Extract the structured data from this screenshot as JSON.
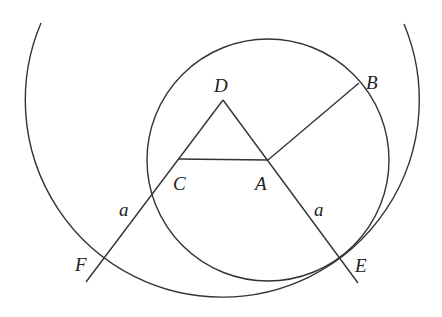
{
  "diagram": {
    "type": "geometry",
    "stroke_color": "#333333",
    "background": "#ffffff",
    "points": {
      "D": {
        "label": "D",
        "x": 223,
        "y": 100,
        "label_x": 214,
        "label_y": 92
      },
      "A": {
        "label": "A",
        "x": 268,
        "y": 160,
        "label_x": 255,
        "label_y": 190
      },
      "C": {
        "label": "C",
        "x": 178,
        "y": 159,
        "label_x": 173,
        "label_y": 190
      },
      "B": {
        "label": "B",
        "x": 359,
        "y": 83,
        "label_x": 366,
        "label_y": 89
      },
      "E": {
        "label": "E",
        "x": 340,
        "y": 262,
        "label_x": 355,
        "label_y": 272
      },
      "F": {
        "label": "F",
        "x": 105,
        "y": 258,
        "label_x": 75,
        "label_y": 271
      }
    },
    "segment_labels": [
      {
        "label": "a",
        "x": 119,
        "y": 216,
        "segment": "CF"
      },
      {
        "label": "a",
        "x": 314,
        "y": 216,
        "segment": "AE"
      }
    ],
    "circles": [
      {
        "name": "circle-centered-A",
        "cx": 268,
        "cy": 160,
        "r": 121
      },
      {
        "name": "arc-centered-D",
        "cx": 223,
        "cy": 100,
        "r": 197,
        "start": [
          41,
          23
        ],
        "end": [
          404,
          24
        ]
      }
    ],
    "segments": [
      {
        "name": "line-DF",
        "from": [
          223,
          100
        ],
        "to": [
          86,
          282
        ]
      },
      {
        "name": "line-DE",
        "from": [
          223,
          100
        ],
        "to": [
          358,
          283
        ]
      },
      {
        "name": "segment-CA",
        "from": [
          178,
          159
        ],
        "to": [
          268,
          160
        ]
      },
      {
        "name": "segment-AB",
        "from": [
          268,
          160
        ],
        "to": [
          359,
          83
        ]
      }
    ]
  }
}
